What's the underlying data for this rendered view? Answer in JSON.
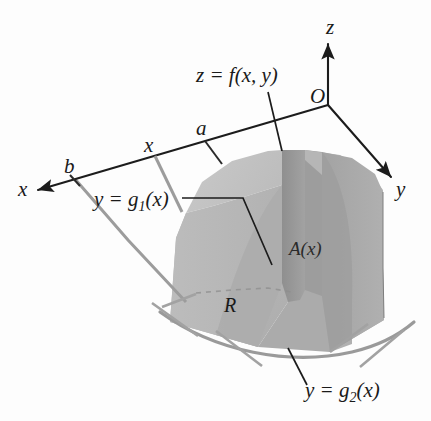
{
  "figure": {
    "kind": "math-diagram",
    "background_color": "#fdfdfd"
  },
  "axes": {
    "z_label": "z",
    "y_label": "y",
    "x_label": "x",
    "origin_label": "O"
  },
  "marks": {
    "a_label": "a",
    "x_label": "x",
    "b_label": "b"
  },
  "labels": {
    "surface": "z = f(x, y)",
    "g1_main": "y = g",
    "g1_sub": "1",
    "g1_tail": "(x)",
    "g2_main": "y = g",
    "g2_sub": "2",
    "g2_tail": "(x)",
    "cross_section": "A(x)",
    "region": "R"
  },
  "colors": {
    "axis": "#1c1c1c",
    "leader": "#1c1c1c",
    "gray_tick": "#9c9c9c",
    "face_left_top": "#c2c2c2",
    "face_left": "#b8b8b8",
    "face_cross_section": "#9a9a9a",
    "face_right": "#a9a9a9",
    "face_right_top": "#b4b4b4",
    "base_region": "#b5b5b5",
    "background": "#fdfdfd"
  }
}
